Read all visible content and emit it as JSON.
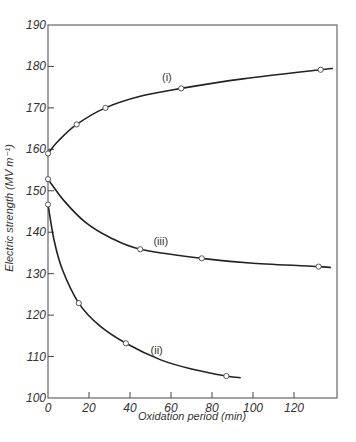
{
  "chart_data": {
    "type": "line",
    "title": "",
    "xlabel": "Oxidation period (min)",
    "ylabel": "Electric strength (MV m⁻¹)",
    "xlim": [
      0,
      140
    ],
    "ylim": [
      100,
      190
    ],
    "xticks": [
      0,
      20,
      40,
      60,
      80,
      100,
      120
    ],
    "yticks": [
      100,
      110,
      120,
      130,
      140,
      150,
      160,
      170,
      180,
      190
    ],
    "grid": false,
    "legend": "none",
    "series": [
      {
        "name": "(i)",
        "label_at": [
          58,
          176.5
        ],
        "points": [
          [
            0,
            159
          ],
          [
            14,
            166
          ],
          [
            28,
            170
          ],
          [
            65,
            174.7
          ],
          [
            133,
            179.2
          ]
        ],
        "curve": [
          [
            0,
            159
          ],
          [
            5,
            162
          ],
          [
            14,
            166
          ],
          [
            28,
            170
          ],
          [
            45,
            172.8
          ],
          [
            65,
            174.7
          ],
          [
            95,
            177
          ],
          [
            133,
            179.2
          ],
          [
            139,
            179.5
          ]
        ]
      },
      {
        "name": "(ii)",
        "label_at": [
          53,
          110.5
        ],
        "points": [
          [
            0,
            146.7
          ],
          [
            15,
            122.9
          ],
          [
            38,
            113.2
          ],
          [
            87,
            105.3
          ]
        ],
        "curve": [
          [
            0,
            146.7
          ],
          [
            3,
            138
          ],
          [
            7,
            131
          ],
          [
            15,
            122.9
          ],
          [
            25,
            117.5
          ],
          [
            38,
            113.2
          ],
          [
            55,
            109.2
          ],
          [
            70,
            107
          ],
          [
            87,
            105.3
          ],
          [
            94,
            104.9
          ]
        ]
      },
      {
        "name": "(iii)",
        "label_at": [
          55,
          136.8
        ],
        "points": [
          [
            0,
            152.8
          ],
          [
            45,
            135.9
          ],
          [
            75,
            133.7
          ],
          [
            132,
            131.7
          ]
        ],
        "curve": [
          [
            0,
            152.8
          ],
          [
            8,
            147.5
          ],
          [
            18,
            142.5
          ],
          [
            30,
            138.8
          ],
          [
            45,
            135.9
          ],
          [
            75,
            133.7
          ],
          [
            100,
            132.5
          ],
          [
            132,
            131.7
          ],
          [
            138,
            131.5
          ]
        ]
      }
    ]
  }
}
